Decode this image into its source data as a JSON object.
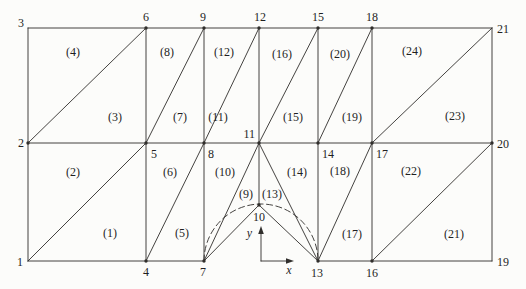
{
  "meta": {
    "background_color": "#fcfcfa",
    "ink_color": "#302e2b",
    "figure_type": "finite-element-triangular-mesh"
  },
  "diagram": {
    "nodes": [
      {
        "id": "1",
        "x": 28,
        "y": 261,
        "dot": false,
        "label": {
          "x": 23,
          "y": 266,
          "anchor": "end"
        }
      },
      {
        "id": "2",
        "x": 28,
        "y": 143,
        "dot": true,
        "label": {
          "x": 24,
          "y": 147,
          "anchor": "end"
        }
      },
      {
        "id": "3",
        "x": 28,
        "y": 28,
        "dot": false,
        "label": {
          "x": 24,
          "y": 27,
          "anchor": "end"
        }
      },
      {
        "id": "4",
        "x": 146,
        "y": 261,
        "dot": true,
        "label": {
          "x": 146,
          "y": 276,
          "anchor": "middle"
        }
      },
      {
        "id": "5",
        "x": 146,
        "y": 143,
        "dot": true,
        "label": {
          "x": 151,
          "y": 158,
          "anchor": "start"
        }
      },
      {
        "id": "6",
        "x": 146,
        "y": 28,
        "dot": true,
        "label": {
          "x": 146,
          "y": 21,
          "anchor": "middle"
        }
      },
      {
        "id": "7",
        "x": 204,
        "y": 261,
        "dot": true,
        "label": {
          "x": 203,
          "y": 276,
          "anchor": "middle"
        }
      },
      {
        "id": "8",
        "x": 204,
        "y": 143,
        "dot": true,
        "label": {
          "x": 208,
          "y": 158,
          "anchor": "start"
        }
      },
      {
        "id": "9",
        "x": 204,
        "y": 28,
        "dot": true,
        "label": {
          "x": 203,
          "y": 21,
          "anchor": "middle"
        }
      },
      {
        "id": "10",
        "x": 259,
        "y": 205,
        "dot": true,
        "label": {
          "x": 259,
          "y": 221,
          "anchor": "middle"
        }
      },
      {
        "id": "11",
        "x": 259,
        "y": 143,
        "dot": true,
        "label": {
          "x": 255,
          "y": 138,
          "anchor": "end"
        }
      },
      {
        "id": "12",
        "x": 259,
        "y": 28,
        "dot": true,
        "label": {
          "x": 260,
          "y": 21,
          "anchor": "middle"
        }
      },
      {
        "id": "13",
        "x": 318,
        "y": 261,
        "dot": true,
        "label": {
          "x": 317,
          "y": 277,
          "anchor": "middle"
        }
      },
      {
        "id": "14",
        "x": 318,
        "y": 143,
        "dot": true,
        "label": {
          "x": 322,
          "y": 158,
          "anchor": "start"
        }
      },
      {
        "id": "15",
        "x": 318,
        "y": 28,
        "dot": true,
        "label": {
          "x": 318,
          "y": 21,
          "anchor": "middle"
        }
      },
      {
        "id": "16",
        "x": 372,
        "y": 261,
        "dot": true,
        "label": {
          "x": 372,
          "y": 277,
          "anchor": "middle"
        }
      },
      {
        "id": "17",
        "x": 372,
        "y": 143,
        "dot": true,
        "label": {
          "x": 376,
          "y": 158,
          "anchor": "start"
        }
      },
      {
        "id": "18",
        "x": 372,
        "y": 28,
        "dot": true,
        "label": {
          "x": 372,
          "y": 21,
          "anchor": "middle"
        }
      },
      {
        "id": "19",
        "x": 492,
        "y": 261,
        "dot": false,
        "label": {
          "x": 497,
          "y": 266,
          "anchor": "start"
        }
      },
      {
        "id": "20",
        "x": 492,
        "y": 143,
        "dot": true,
        "label": {
          "x": 497,
          "y": 148,
          "anchor": "start"
        }
      },
      {
        "id": "21",
        "x": 492,
        "y": 28,
        "dot": false,
        "label": {
          "x": 497,
          "y": 33,
          "anchor": "start"
        }
      }
    ],
    "edges": [
      [
        "3",
        "21"
      ],
      [
        "3",
        "1"
      ],
      [
        "21",
        "19"
      ],
      [
        "1",
        "7"
      ],
      [
        "13",
        "19"
      ],
      [
        "2",
        "20"
      ],
      [
        "6",
        "4"
      ],
      [
        "9",
        "7"
      ],
      [
        "12",
        "10"
      ],
      [
        "15",
        "13"
      ],
      [
        "18",
        "16"
      ],
      [
        "1",
        "5"
      ],
      [
        "2",
        "6"
      ],
      [
        "4",
        "8"
      ],
      [
        "5",
        "9"
      ],
      [
        "7",
        "11"
      ],
      [
        "8",
        "12"
      ],
      [
        "7",
        "10"
      ],
      [
        "10",
        "13"
      ],
      [
        "11",
        "13"
      ],
      [
        "11",
        "15"
      ],
      [
        "13",
        "17"
      ],
      [
        "14",
        "18"
      ],
      [
        "16",
        "20"
      ],
      [
        "17",
        "21"
      ]
    ],
    "hole_arc": {
      "from": "7",
      "to": "13",
      "radius": 57,
      "style": "dashed"
    },
    "elements": [
      {
        "n": 1,
        "label": "(1)",
        "x": 110,
        "y": 237
      },
      {
        "n": 2,
        "label": "(2)",
        "x": 73,
        "y": 176
      },
      {
        "n": 3,
        "label": "(3)",
        "x": 115,
        "y": 121
      },
      {
        "n": 4,
        "label": "(4)",
        "x": 73,
        "y": 56
      },
      {
        "n": 5,
        "label": "(5)",
        "x": 182,
        "y": 237
      },
      {
        "n": 6,
        "label": "(6)",
        "x": 170,
        "y": 176
      },
      {
        "n": 7,
        "label": "(7)",
        "x": 180,
        "y": 121
      },
      {
        "n": 8,
        "label": "(8)",
        "x": 167,
        "y": 56
      },
      {
        "n": 9,
        "label": "(9)",
        "x": 246,
        "y": 198
      },
      {
        "n": 10,
        "label": "(10)",
        "x": 225,
        "y": 176
      },
      {
        "n": 11,
        "label": "(11)",
        "x": 218,
        "y": 121
      },
      {
        "n": 12,
        "label": "(12)",
        "x": 224,
        "y": 56
      },
      {
        "n": 13,
        "label": "(13)",
        "x": 272,
        "y": 198
      },
      {
        "n": 14,
        "label": "(14)",
        "x": 297,
        "y": 176
      },
      {
        "n": 15,
        "label": "(15)",
        "x": 293,
        "y": 121
      },
      {
        "n": 16,
        "label": "(16)",
        "x": 282,
        "y": 58
      },
      {
        "n": 17,
        "label": "(17)",
        "x": 352,
        "y": 238
      },
      {
        "n": 18,
        "label": "(18)",
        "x": 340,
        "y": 175
      },
      {
        "n": 19,
        "label": "(19)",
        "x": 352,
        "y": 121
      },
      {
        "n": 20,
        "label": "(20)",
        "x": 340,
        "y": 58
      },
      {
        "n": 21,
        "label": "(21)",
        "x": 454,
        "y": 238
      },
      {
        "n": 22,
        "label": "(22)",
        "x": 411,
        "y": 175
      },
      {
        "n": 23,
        "label": "(23)",
        "x": 455,
        "y": 120
      },
      {
        "n": 24,
        "label": "(24)",
        "x": 412,
        "y": 55
      }
    ],
    "axes": {
      "origin": [
        261,
        261
      ],
      "x_stem_end": [
        287,
        261
      ],
      "y_stem_end": [
        261,
        233
      ],
      "x_arrow": "294,261 286,258.2 286,263.8",
      "y_arrow": "261,226 258.2,234 263.8,234",
      "x_label": {
        "text": "x",
        "x": 289,
        "y": 274
      },
      "y_label": {
        "text": "y",
        "x": 252,
        "y": 237
      }
    }
  }
}
